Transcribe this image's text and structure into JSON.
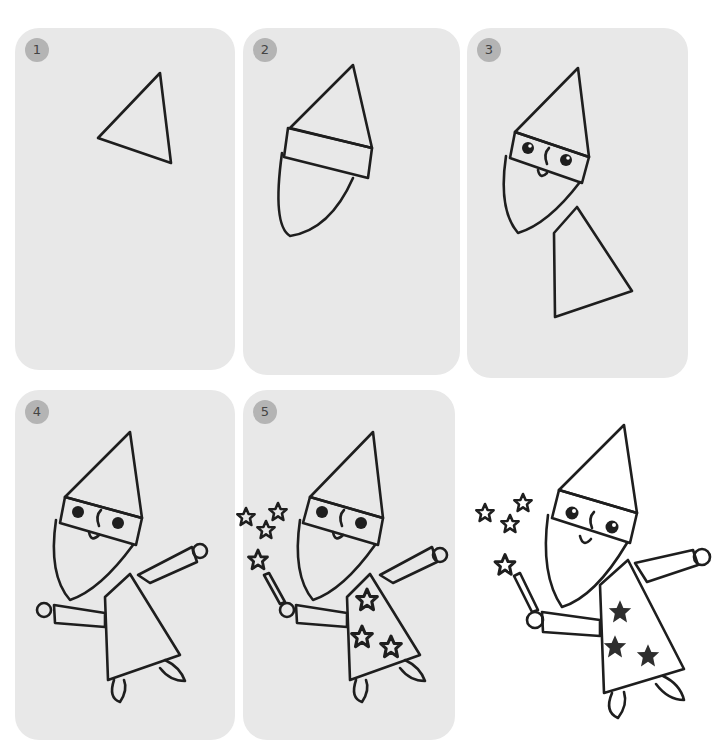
{
  "steps": [
    {
      "number": "1",
      "description": "Draw a triangle for the hat"
    },
    {
      "number": "2",
      "description": "Add the hat band and the beard"
    },
    {
      "number": "3",
      "description": "Draw eyes, nose, smile and the robe"
    },
    {
      "number": "4",
      "description": "Add arms, hands and feet"
    },
    {
      "number": "5",
      "description": "Add the wand, sparkles and stars on the robe"
    }
  ],
  "final": {
    "label": "Finished wizard"
  },
  "colors": {
    "panel_bg": "#e8e8e8",
    "badge_bg": "#b4b4b4",
    "line": "#1e1e1e",
    "hat_fill": "#6e6e6e",
    "face_fill": "#b9b9b9",
    "robe_fill": "#707070",
    "star_fill": "#2e2e2e"
  }
}
